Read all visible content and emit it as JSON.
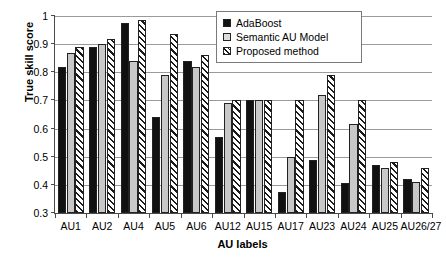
{
  "chart_data": {
    "type": "bar",
    "title": "",
    "xlabel": "AU labels",
    "ylabel": "True skill score",
    "ylim": [
      0.3,
      1.0
    ],
    "ytick_labels": [
      "0.3",
      "0.4",
      "0.5",
      "0.6",
      "0.7",
      "0.8",
      "0.9",
      "1"
    ],
    "ytick_values": [
      0.3,
      0.4,
      0.5,
      0.6,
      0.7,
      0.8,
      0.9,
      1.0
    ],
    "grid": "horizontal",
    "legend_position": "top-right-inside",
    "categories": [
      "AU1",
      "AU2",
      "AU4",
      "AU5",
      "AU6",
      "AU12",
      "AU15",
      "AU17",
      "AU23",
      "AU24",
      "AU25",
      "AU26/27"
    ],
    "series": [
      {
        "name": "AdaBoost",
        "color": "#111111",
        "pattern": "solid-black",
        "values": [
          0.82,
          0.89,
          0.975,
          0.64,
          0.84,
          0.57,
          0.7,
          0.375,
          0.49,
          0.405,
          0.47,
          0.42
        ]
      },
      {
        "name": "Semantic AU Model",
        "color": "#c8c8c8",
        "pattern": "solid-light-gray",
        "values": [
          0.87,
          0.9,
          0.84,
          0.79,
          0.82,
          0.69,
          0.7,
          0.5,
          0.72,
          0.615,
          0.46,
          0.41
        ]
      },
      {
        "name": "Proposed method",
        "color": "#ffffff",
        "pattern": "diagonal-hatch",
        "values": [
          0.89,
          0.92,
          0.985,
          0.935,
          0.86,
          0.7,
          0.7,
          0.7,
          0.79,
          0.7,
          0.48,
          0.46
        ]
      }
    ]
  }
}
